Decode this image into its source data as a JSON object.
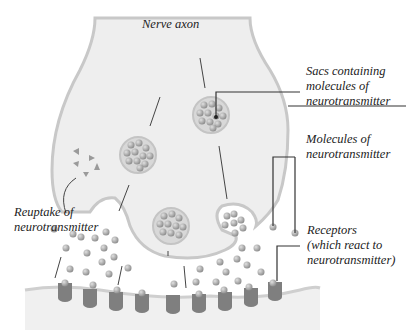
{
  "diagram": {
    "labels": {
      "nerve_axon": "Nerve axon",
      "sacs": "Sacs containing\nmolecules of\nneurotransmitter",
      "molecules": "Molecules of\nneurotransmitter",
      "receptors": "Receptors\n(which react to\nneurotransmitter)",
      "reuptake": "Reuptake of\nneurotransmitter"
    },
    "colors": {
      "axon_fill": "#eeeeee",
      "axon_outline": "#c8c8c8",
      "sac_fill": "#d8d8d8",
      "molecule": "#9a9a9a",
      "receptor": "#7f7f7f",
      "membrane": "#cfcfcf",
      "leader_line": "#333333"
    }
  }
}
